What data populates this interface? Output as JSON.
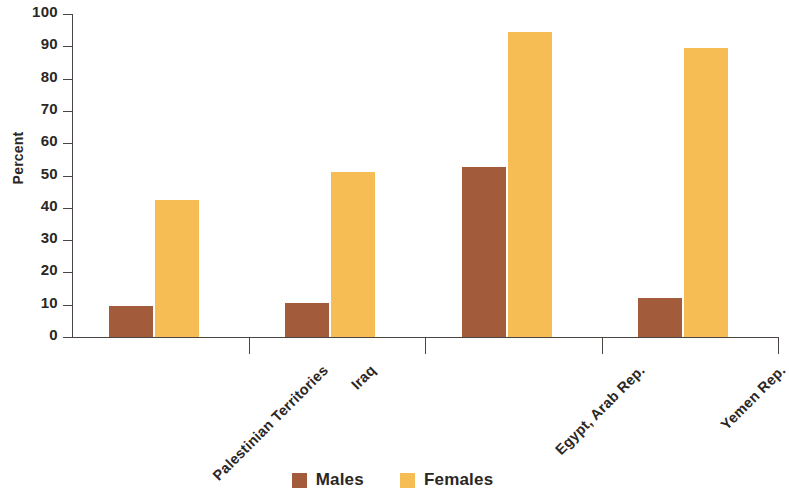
{
  "chart_data": {
    "type": "bar",
    "title": "",
    "subtitle": "",
    "xlabel": "",
    "ylabel": "Percent",
    "ylim": [
      0,
      100
    ],
    "yticks": [
      0,
      10,
      20,
      30,
      40,
      50,
      60,
      70,
      80,
      90,
      100
    ],
    "ytick_labels": [
      "0",
      "10",
      "20",
      "30",
      "40",
      "50",
      "60",
      "70",
      "80",
      "90",
      "100"
    ],
    "grid": false,
    "legend_position": "bottom-center",
    "categories": [
      "Palestinian Territories",
      "Iraq",
      "Egypt, Arab Rep.",
      "Yemen Rep."
    ],
    "series": [
      {
        "name": "Males",
        "color": "#a25c3c",
        "values": [
          9.5,
          10.5,
          52.5,
          12
        ]
      },
      {
        "name": "Females",
        "color": "#f5bd53",
        "values": [
          42.5,
          51,
          94.5,
          89.5
        ]
      }
    ],
    "legend": [
      {
        "label": "Males",
        "color": "#a25c3c",
        "swatch": "legend-swatch-males"
      },
      {
        "label": "Females",
        "color": "#f5bd53",
        "swatch": "legend-swatch-females"
      }
    ],
    "annotations": []
  }
}
